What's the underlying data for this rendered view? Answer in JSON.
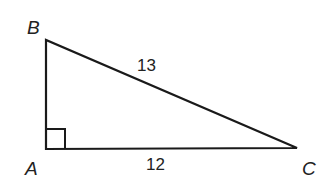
{
  "diagram": {
    "type": "right-triangle",
    "vertices": {
      "A": {
        "label": "A",
        "x": 46,
        "y": 149
      },
      "B": {
        "label": "B",
        "x": 46,
        "y": 40
      },
      "C": {
        "label": "C",
        "x": 297,
        "y": 148
      }
    },
    "sides": {
      "BC": {
        "label": "13"
      },
      "AC": {
        "label": "12"
      }
    },
    "right_angle_at": "A",
    "stroke_color": "#1a1a1a"
  }
}
